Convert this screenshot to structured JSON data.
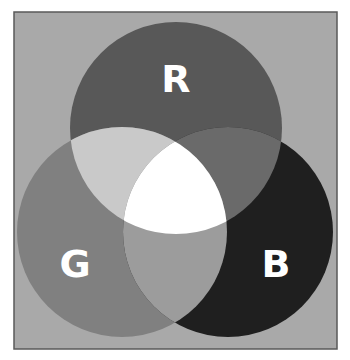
{
  "diagram": {
    "type": "venn",
    "frame": {
      "x": 14,
      "y": 12,
      "width": 323,
      "height": 337,
      "fill": "#a9a9a9",
      "stroke": "#5a5a5a"
    },
    "circles": [
      {
        "id": "red",
        "label": "R",
        "cx": 176,
        "cy": 128,
        "rx": 106,
        "ry": 106,
        "fill": "#585858",
        "label_x": 176,
        "label_y": 92
      },
      {
        "id": "green",
        "label": "G",
        "cx": 122,
        "cy": 232,
        "rx": 105,
        "ry": 105,
        "fill": "#808080",
        "label_x": 75,
        "label_y": 264
      },
      {
        "id": "blue",
        "label": "B",
        "cx": 228,
        "cy": 232,
        "rx": 105,
        "ry": 105,
        "fill": "#1f1f1f",
        "label_x": 275,
        "label_y": 264
      }
    ],
    "overlaps": {
      "red_green": "#c9c9c9",
      "red_blue": "#6a6a6a",
      "green_blue": "#9c9c9c",
      "all_three": "#ffffff"
    },
    "labels": {
      "r": "R",
      "g": "G",
      "b": "B"
    }
  }
}
